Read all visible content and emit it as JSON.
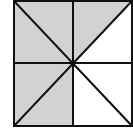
{
  "diagram": {
    "colors": {
      "shade": "#d2d2d2",
      "line": "#111111",
      "background": "#ffffff"
    },
    "square": {
      "x": 14,
      "y": 1,
      "size": 118
    },
    "shaded_regions": [
      "top-left-upper",
      "top-left-lower",
      "top-right-upper",
      "bottom-left-upper",
      "bottom-left-lower"
    ],
    "unshaded_regions": [
      "top-right-lower",
      "bottom-right-upper",
      "bottom-right-lower"
    ]
  }
}
